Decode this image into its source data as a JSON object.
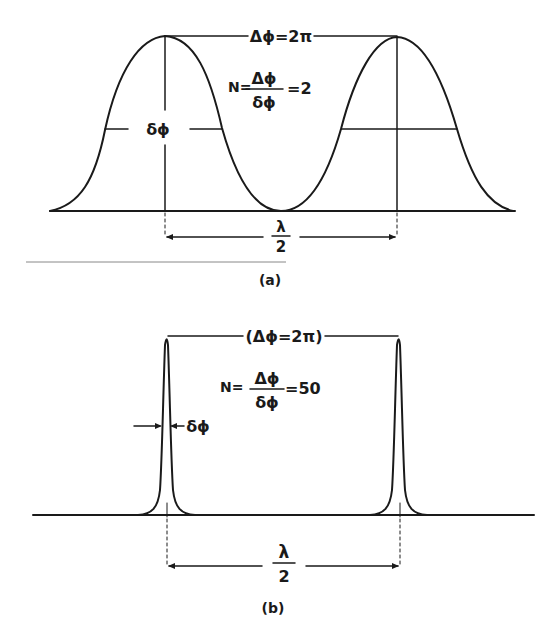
{
  "panel_a": {
    "caption": "(a)",
    "period_label": "Δϕ=2π",
    "n_prefix": "N=",
    "n_numerator": "Δϕ",
    "n_denominator": "δϕ",
    "n_value": "=2",
    "width_label": "δϕ",
    "spacing_numerator": "λ",
    "spacing_denominator": "2"
  },
  "panel_b": {
    "caption": "(b)",
    "period_label": "(Δϕ=2π)",
    "n_prefix": "N=",
    "n_numerator": "Δϕ",
    "n_denominator": "δϕ",
    "n_value": "=50",
    "width_label": "δϕ",
    "spacing_numerator": "λ",
    "spacing_denominator": "2"
  },
  "colors": {
    "ink": "#1a1a1a",
    "background": "#ffffff"
  }
}
